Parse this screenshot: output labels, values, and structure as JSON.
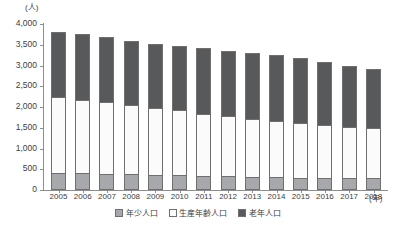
{
  "chart_data": {
    "type": "bar",
    "stacked": true,
    "title": "",
    "xlabel": "(年)",
    "ylabel": "(人)",
    "ylim": [
      0,
      4000
    ],
    "ytick_step": 500,
    "yticks": [
      "4,000",
      "3,500",
      "3,000",
      "2,500",
      "2,000",
      "1,500",
      "1,000",
      "500",
      "0"
    ],
    "grid": false,
    "legend_position": "bottom",
    "categories": [
      "2005",
      "2006",
      "2007",
      "2008",
      "2009",
      "2010",
      "2011",
      "2012",
      "2013",
      "2014",
      "2015",
      "2016",
      "2017",
      "2018"
    ],
    "series": [
      {
        "name": "年少人口",
        "color": "#a6a8ab",
        "values": [
          410,
          400,
          390,
          375,
          360,
          350,
          340,
          330,
          320,
          310,
          300,
          295,
          285,
          280
        ]
      },
      {
        "name": "生産年齢人口",
        "color": "#fbfbfb",
        "values": [
          1830,
          1780,
          1730,
          1665,
          1620,
          1570,
          1500,
          1450,
          1400,
          1355,
          1310,
          1265,
          1225,
          1225
        ]
      },
      {
        "name": "老年人口",
        "color": "#58595b",
        "values": [
          1560,
          1570,
          1560,
          1540,
          1540,
          1540,
          1580,
          1580,
          1580,
          1580,
          1580,
          1520,
          1470,
          1420
        ]
      }
    ],
    "totals": [
      3800,
      3750,
      3680,
      3580,
      3520,
      3460,
      3420,
      3360,
      3300,
      3245,
      3190,
      3080,
      2980,
      2925
    ]
  },
  "legend": {
    "items": [
      {
        "label": "年少人口",
        "swatch": "young-swatch"
      },
      {
        "label": "生産年齢人口",
        "swatch": "work-swatch"
      },
      {
        "label": "老年人口",
        "swatch": "old-swatch"
      }
    ]
  }
}
